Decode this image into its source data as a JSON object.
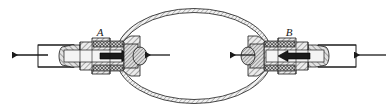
{
  "figure": {
    "background_color": "#ffffff",
    "line_color": "#1a1a1a",
    "hatch_color": "#555555",
    "fill_light": "#e8e8e8",
    "fill_mid": "#bfbfbf",
    "fill_dark": "#2a2a2a",
    "width": 389,
    "height": 111
  },
  "labels": {
    "electrode_a": "A",
    "electrode_b": "B"
  },
  "arrows": [
    {
      "name": "outer-left-arrow",
      "direction": "left",
      "x_tail": 48,
      "x_head": 10,
      "y": 55
    },
    {
      "name": "inner-left-arrow",
      "direction": "left",
      "x_tail": 170,
      "x_head": 143,
      "y": 55
    },
    {
      "name": "inner-right-arrow",
      "direction": "left",
      "x_tail": 255,
      "x_head": 228,
      "y": 55
    },
    {
      "name": "outer-right-arrow",
      "direction": "left",
      "x_tail": 385,
      "x_head": 352,
      "y": 55
    }
  ],
  "components": {
    "bulb": {
      "name": "glass-bulb",
      "cx": 194,
      "cy": 56,
      "rx": 78,
      "ry": 47
    },
    "left_tube": {
      "name": "left-outer-tube",
      "x": 38,
      "y": 45,
      "w": 34,
      "h": 22
    },
    "right_tube": {
      "name": "right-outer-tube",
      "x": 318,
      "y": 45,
      "w": 36,
      "h": 22
    },
    "left_assembly": {
      "name": "left-electrode-assembly",
      "x": 60,
      "y": 36,
      "w": 78,
      "h": 40
    },
    "right_assembly": {
      "name": "right-electrode-assembly",
      "x": 252,
      "y": 36,
      "w": 80,
      "h": 40
    }
  }
}
